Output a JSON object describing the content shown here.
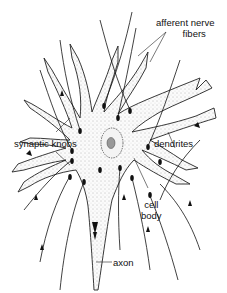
{
  "figure": {
    "labels": {
      "afferent_line1": "afferent nerve",
      "afferent_line2": "fibers",
      "synaptic_knobs": "synaptic knobs",
      "dendrites": "dendrites",
      "cell_line1": "cell",
      "cell_line2": "body",
      "axon": "axon"
    }
  }
}
